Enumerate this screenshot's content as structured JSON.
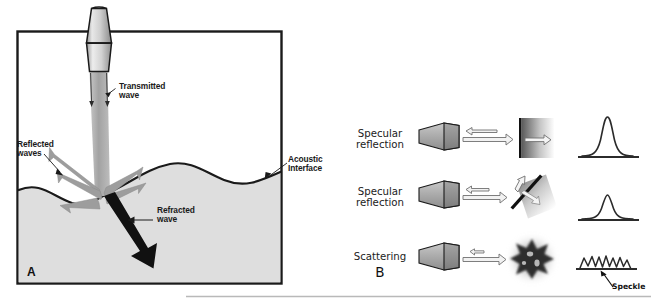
{
  "figure": {
    "panel_a": {
      "letter": "A",
      "labels": {
        "transmitted_wave": "Transmitted\nwave",
        "reflected_waves": "Reflected\nwaves",
        "acoustic_interface": "Acoustic\nInterface",
        "refracted_wave": "Refracted\nwave"
      }
    },
    "panel_b": {
      "letter": "B",
      "rows": [
        {
          "label": "Specular\nreflection",
          "target": "flat-perpendicular-reflector",
          "trace": "tall-narrow-gaussian-peak"
        },
        {
          "label": "Specular\nreflection",
          "target": "tilted-reflector",
          "trace": "short-gaussian-peak"
        },
        {
          "label": "Scattering",
          "target": "irregular-scatterer",
          "trace": "jagged-speckle-trace"
        }
      ],
      "annotation": {
        "speckle": "Speckle"
      }
    },
    "colors": {
      "medium_fill": "#dedede",
      "beam_gray": "#a8a8a8",
      "arrow_gray": "#9a9a9a",
      "outline_black": "#1a1a1a",
      "transducer_gray": "#b5b5b5",
      "divider_gray": "#b9b9b9"
    }
  }
}
